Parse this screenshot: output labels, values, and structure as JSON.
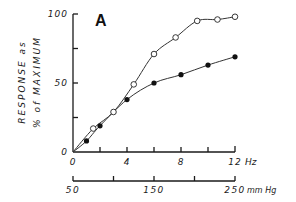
{
  "chart_data": {
    "type": "line",
    "title": "",
    "panel_label": "A",
    "xlabel": "Hz",
    "x2label": "mm Hg",
    "ylabel_line1": "RESPONSE as",
    "ylabel_line2": "% of MAXIMUM",
    "xlim": [
      0,
      12
    ],
    "ylim": [
      0,
      100
    ],
    "x_ticks": [
      0,
      2,
      4,
      6,
      8,
      10,
      12
    ],
    "x_tick_labels": [
      "0",
      "4",
      "8",
      "12"
    ],
    "x_tick_label_values": [
      0,
      4,
      8,
      12
    ],
    "y_ticks": [
      0,
      25,
      50,
      75,
      100
    ],
    "y_tick_labels": [
      "0",
      "50",
      "100"
    ],
    "y_tick_label_values": [
      0,
      50,
      100
    ],
    "x2_ticks": [
      50,
      100,
      150,
      200,
      250
    ],
    "x2_tick_labels": [
      "50",
      "150",
      "250"
    ],
    "x2_tick_label_values": [
      50,
      150,
      250
    ],
    "grid": false,
    "legend": null,
    "series": [
      {
        "name": "open circles",
        "marker": "open-circle",
        "x": [
          1.5,
          3,
          4.5,
          6,
          7.6,
          9.2,
          10.7,
          12
        ],
        "y": [
          17,
          29,
          49,
          71,
          83,
          95,
          96,
          98
        ]
      },
      {
        "name": "filled circles",
        "marker": "filled-circle",
        "x": [
          1,
          2,
          4,
          6,
          8,
          10,
          12
        ],
        "y": [
          8,
          19,
          38,
          50,
          56,
          63,
          69
        ]
      }
    ]
  }
}
